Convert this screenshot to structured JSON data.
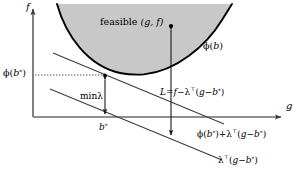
{
  "figure": {
    "type": "diagram",
    "background_color": "#ffffff",
    "shade_color": "#c8c8c8",
    "line_color": "#000000",
    "axes": {
      "x_label": "g",
      "y_label": "f",
      "origin_px": [
        33,
        117
      ],
      "x_end_px": [
        285,
        117
      ],
      "y_top_px": [
        33,
        5
      ]
    },
    "labels": {
      "feasible_region": "feasible (g, f)",
      "phi_curve": "ϕ(b)",
      "phi_bstar_axis": "ϕ(b⁎)",
      "b_star": "b⁎",
      "min_lambda": "minλ",
      "lagrangian": "L = f − λᵀ(g − b⁎)",
      "supporting_line": "ϕ(b⁎) + λᵀ(g − b⁎)",
      "lambda_line": "λᵀ(g − b⁎)"
    },
    "label_parts": {
      "feasible": {
        "word": "feasible",
        "args": "(g, f)"
      },
      "phi_b": {
        "phi": "ϕ",
        "arg": "b"
      },
      "phi_bstar": {
        "phi": "ϕ",
        "arg": "b",
        "star": "⁎"
      },
      "bstar": {
        "base": "b",
        "star": "⁎"
      },
      "minlam": {
        "min": "min",
        "lam": "λ"
      },
      "L": {
        "lhs": "L",
        "eq": "=",
        "f": "f",
        "minus": "−",
        "lam": "λ",
        "T": "⊤",
        "open": "(",
        "g": "g",
        "dash": "−",
        "b": "b",
        "star": "⁎",
        "close": ")"
      },
      "support": {
        "phi": "ϕ",
        "open1": "(",
        "b1": "b",
        "star1": "⁎",
        "close1": ")",
        "plus": "+",
        "lam": "λ",
        "T": "⊤",
        "open2": "(",
        "g": "g",
        "dash": "−",
        "b2": "b",
        "star2": "⁎",
        "close2": ")"
      },
      "lamline": {
        "lam": "λ",
        "T": "⊤",
        "open": "(",
        "g": "g",
        "dash": "−",
        "b": "b",
        "star": "⁎",
        "close": ")"
      }
    },
    "geometry": {
      "parabola_vertex_px": [
        140,
        74
      ],
      "parabola_left_top_px": [
        57,
        5
      ],
      "parabola_right_top_px": [
        232,
        5
      ],
      "tangent_point_px": [
        105,
        75
      ],
      "phi_level_y_px": 75,
      "b_star_x_px": 105,
      "duality_gap_arrow_x_px": 171,
      "feasible_point_px": [
        171,
        26
      ]
    }
  }
}
